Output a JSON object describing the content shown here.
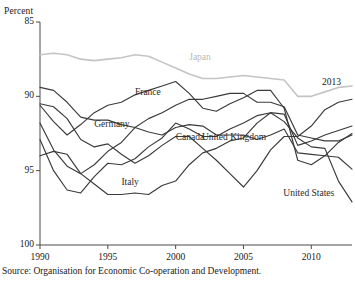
{
  "axis": {
    "unit_label": "Percent",
    "y_ticks": [
      "100",
      "95",
      "90",
      "85"
    ],
    "x_ticks": [
      "1990",
      "1995",
      "2000",
      "2005",
      "2010"
    ]
  },
  "annotations": {
    "end_year": "2013"
  },
  "source": "Source: Organisation for Economic Co-operation and Development.",
  "colors": {
    "line_dark": "#3a3a3a",
    "line_japan": "#c4c4c4",
    "axis": "#4a4a4a",
    "text": "#1a1a1a"
  },
  "chart_data": {
    "type": "line",
    "title": "",
    "subtitle": "",
    "xlabel": "",
    "ylabel": "Percent",
    "xlim": [
      1990,
      2013
    ],
    "ylim": [
      85,
      100
    ],
    "y_ticks": [
      85,
      90,
      95,
      100
    ],
    "x_ticks": [
      1990,
      1995,
      2000,
      2005,
      2010
    ],
    "grid": false,
    "legend": "inline-labels",
    "x": [
      1990,
      1991,
      1992,
      1993,
      1994,
      1995,
      1996,
      1997,
      1998,
      1999,
      2000,
      2001,
      2002,
      2003,
      2004,
      2005,
      2006,
      2007,
      2008,
      2009,
      2010,
      2011,
      2012,
      2013
    ],
    "series": [
      {
        "name": "Japan",
        "color": "#c4c4c4",
        "label_x": 2001,
        "label_y": 97.6,
        "values": [
          97.8,
          97.9,
          97.8,
          97.5,
          97.4,
          97.5,
          97.6,
          97.8,
          97.7,
          97.3,
          96.9,
          96.5,
          96.2,
          96.2,
          96.3,
          96.4,
          96.3,
          96.2,
          96.1,
          95.0,
          95.0,
          95.3,
          95.6,
          95.7
        ]
      },
      {
        "name": "France",
        "color": "#3a3a3a",
        "label_x": 1997,
        "label_y": 95.2,
        "values": [
          95.6,
          95.4,
          94.6,
          93.6,
          93.4,
          93.4,
          93.1,
          92.9,
          92.6,
          92.4,
          92.9,
          93.1,
          93.0,
          92.4,
          92.4,
          92.4,
          92.1,
          92.4,
          92.8,
          91.2,
          91.1,
          91.0,
          90.9,
          90.1
        ]
      },
      {
        "name": "Germany",
        "color": "#3a3a3a",
        "label_x": 1994,
        "label_y": 93.1,
        "values": [
          94.5,
          94.3,
          93.5,
          92.1,
          91.6,
          91.8,
          91.1,
          90.5,
          91.0,
          91.7,
          92.3,
          92.3,
          91.5,
          90.7,
          89.8,
          88.9,
          90.0,
          91.4,
          92.3,
          92.3,
          93.0,
          94.1,
          94.6,
          94.8
        ]
      },
      {
        "name": "Canada",
        "color": "#3a3a3a",
        "label_x": 2000,
        "label_y": 92.2,
        "values": [
          92.1,
          90.0,
          88.7,
          88.5,
          89.6,
          90.5,
          90.4,
          90.8,
          91.6,
          92.2,
          93.2,
          92.8,
          92.3,
          92.3,
          92.8,
          93.2,
          93.7,
          93.9,
          93.8,
          91.7,
          92.0,
          92.4,
          92.7,
          93.0
        ]
      },
      {
        "name": "United Kingdom",
        "color": "#3a3a3a",
        "label_x": 2004,
        "label_y": 92.2,
        "values": [
          93.2,
          91.4,
          90.3,
          89.8,
          90.4,
          91.3,
          91.9,
          92.9,
          93.5,
          93.9,
          94.4,
          94.8,
          94.8,
          95.0,
          95.2,
          95.2,
          94.6,
          94.6,
          94.3,
          92.4,
          92.2,
          92.0,
          92.0,
          92.4
        ]
      },
      {
        "name": "Italy",
        "color": "#3a3a3a",
        "label_x": 1996,
        "label_y": 89.2,
        "values": [
          91.0,
          91.3,
          91.1,
          89.8,
          89.1,
          88.4,
          88.4,
          88.5,
          88.4,
          89.0,
          89.3,
          90.4,
          91.2,
          91.5,
          92.0,
          92.2,
          93.2,
          93.9,
          93.3,
          92.2,
          91.6,
          91.5,
          89.3,
          87.9
        ]
      },
      {
        "name": "United States",
        "color": "#3a3a3a",
        "label_x": 2010,
        "label_y": 88.4,
        "values": [
          94.4,
          93.3,
          92.4,
          93.1,
          93.9,
          94.4,
          94.6,
          95.1,
          95.4,
          95.7,
          96.0,
          95.2,
          94.2,
          94.0,
          94.5,
          94.9,
          95.4,
          95.4,
          94.2,
          90.7,
          90.4,
          91.0,
          91.9,
          92.5
        ]
      }
    ]
  }
}
